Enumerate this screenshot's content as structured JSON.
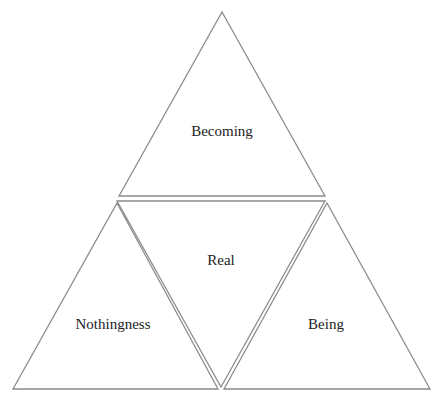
{
  "diagram": {
    "type": "four-triangle composition",
    "stroke_color": "#8a8a8a",
    "text_color": "#222222",
    "triangles": [
      {
        "id": "top",
        "label": "Becoming",
        "orientation": "up"
      },
      {
        "id": "center",
        "label": "Real",
        "orientation": "down"
      },
      {
        "id": "left",
        "label": "Nothingness",
        "orientation": "up"
      },
      {
        "id": "right",
        "label": "Being",
        "orientation": "up"
      }
    ]
  }
}
